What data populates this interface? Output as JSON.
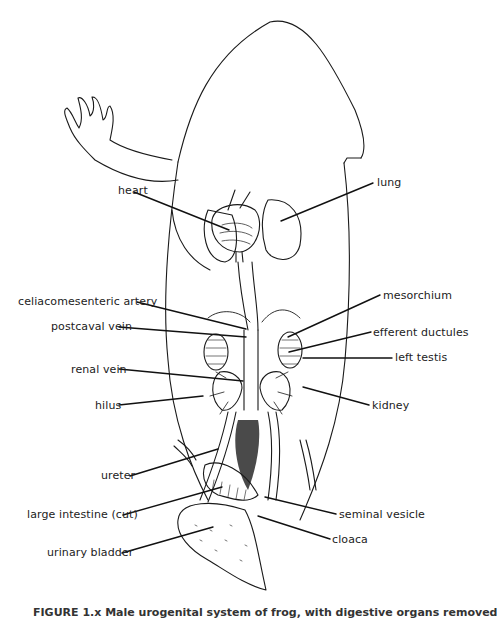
{
  "figure": {
    "labels": [
      {
        "id": "heart",
        "text": "heart",
        "x": 118,
        "y": 185,
        "lx": 134,
        "ly": 192,
        "tx": 229,
        "ty": 230
      },
      {
        "id": "lung",
        "text": "lung",
        "x": 377,
        "y": 177,
        "lx": 373,
        "ly": 183,
        "tx": 281,
        "ty": 221
      },
      {
        "id": "celiacomesenteric-artery",
        "text": "celiacomesenteric artery",
        "x": 18,
        "y": 296,
        "lx": 137,
        "ly": 302,
        "tx": 246,
        "ty": 329
      },
      {
        "id": "postcaval-vein",
        "text": "postcaval vein",
        "x": 51,
        "y": 321,
        "lx": 119,
        "ly": 327,
        "tx": 246,
        "ty": 337
      },
      {
        "id": "renal-vein",
        "text": "renal vein",
        "x": 71,
        "y": 364,
        "lx": 119,
        "ly": 369,
        "tx": 243,
        "ty": 381
      },
      {
        "id": "hilus",
        "text": "hilus",
        "x": 95,
        "y": 400,
        "lx": 119,
        "ly": 405,
        "tx": 203,
        "ty": 396
      },
      {
        "id": "mesorchium",
        "text": "mesorchium",
        "x": 383,
        "y": 290,
        "lx": 380,
        "ly": 295,
        "tx": 288,
        "ty": 337
      },
      {
        "id": "efferent-ductules",
        "text": "efferent ductules",
        "x": 373,
        "y": 327,
        "lx": 371,
        "ly": 332,
        "tx": 289,
        "ty": 352
      },
      {
        "id": "left-testis",
        "text": "left testis",
        "x": 395,
        "y": 352,
        "lx": 392,
        "ly": 358,
        "tx": 303,
        "ty": 358
      },
      {
        "id": "kidney",
        "text": "kidney",
        "x": 372,
        "y": 400,
        "lx": 369,
        "ly": 405,
        "tx": 303,
        "ty": 387
      },
      {
        "id": "ureter",
        "text": "ureter",
        "x": 101,
        "y": 470,
        "lx": 130,
        "ly": 476,
        "tx": 218,
        "ty": 449
      },
      {
        "id": "large-intestine-cut",
        "text": "large intestine (cut)",
        "x": 27,
        "y": 509,
        "lx": 123,
        "ly": 515,
        "tx": 222,
        "ty": 487
      },
      {
        "id": "seminal-vesicle",
        "text": "seminal vesicle",
        "x": 339,
        "y": 509,
        "lx": 336,
        "ly": 514,
        "tx": 265,
        "ty": 497
      },
      {
        "id": "cloaca",
        "text": "cloaca",
        "x": 332,
        "y": 534,
        "lx": 330,
        "ly": 539,
        "tx": 258,
        "ty": 516
      },
      {
        "id": "urinary-bladder",
        "text": "urinary bladder",
        "x": 47,
        "y": 547,
        "lx": 122,
        "ly": 553,
        "tx": 213,
        "ty": 527
      }
    ],
    "caption": "FIGURE 1.x   Male urogenital system of frog, with digestive organs removed"
  }
}
